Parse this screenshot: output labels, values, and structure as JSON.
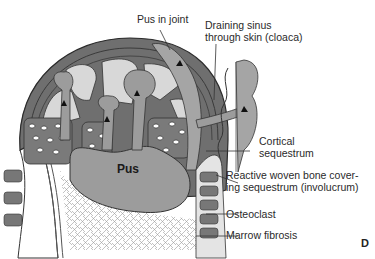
{
  "figure": {
    "panel_letter": "D",
    "center_label": "Pus",
    "labels": [
      {
        "id": "pus-in-joint",
        "text": "Pus in joint"
      },
      {
        "id": "draining-sinus",
        "line1": "Draining sinus",
        "line2": "through skin (cloaca)"
      },
      {
        "id": "cortical-sequestrum",
        "line1": "Cortical",
        "line2": "sequestrum"
      },
      {
        "id": "involucrum",
        "line1": "Reactive woven bone cover-",
        "line2": "ing sequestrum (involucrum)"
      },
      {
        "id": "osteoclast",
        "text": "Osteoclast"
      },
      {
        "id": "marrow-fibrosis",
        "text": "Marrow fibrosis"
      }
    ],
    "colors": {
      "bone_dark": "#6e6e6e",
      "bone_mid": "#8c8c8c",
      "pus_fill": "#a0a0a0",
      "light_space": "#d6d6d6",
      "outline": "#2b2b2b",
      "background": "#ffffff"
    }
  }
}
